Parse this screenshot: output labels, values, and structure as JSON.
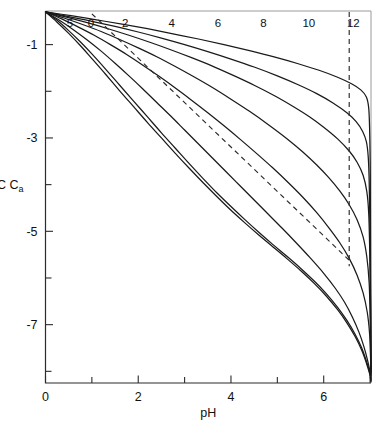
{
  "figure": {
    "background_color": "#ffffff",
    "line_color": "#1a1a1a",
    "dash_color": "#2b2b2b",
    "caption": ""
  },
  "chart_data": {
    "type": "line",
    "title": "",
    "subtitle": "",
    "xlabel": "pH",
    "ylabel": "log C",
    "ylabel_subscript": "a",
    "xlim": [
      0,
      7.02
    ],
    "ylim": [
      -8.25,
      -0.28
    ],
    "grid": false,
    "legend_position": "inline-curve-labels",
    "x_ticks_labeled": [
      0,
      2,
      4,
      6
    ],
    "x_tick_labels": [
      "0",
      "2",
      "4",
      "6"
    ],
    "x_ticks_minor": [
      1,
      3,
      5,
      7
    ],
    "y_ticks_labeled": [
      -1,
      -3,
      -5,
      -7
    ],
    "y_tick_labels": [
      "-1",
      "-3",
      "-5",
      "-7"
    ],
    "y_ticks_minor": [
      -2,
      -4,
      -6,
      -8
    ],
    "series": [
      {
        "name": "5",
        "label": "5",
        "label_x": 0.53,
        "label_y": -0.62,
        "style": "solid",
        "points": [
          [
            0.0,
            -0.3
          ],
          [
            0.25,
            -0.52
          ],
          [
            0.5,
            -0.76
          ],
          [
            0.75,
            -1.02
          ],
          [
            1.0,
            -1.3
          ],
          [
            1.3,
            -1.64
          ],
          [
            1.6,
            -1.99
          ],
          [
            1.9,
            -2.33
          ],
          [
            2.2,
            -2.67
          ],
          [
            2.5,
            -3.0
          ],
          [
            2.8,
            -3.33
          ],
          [
            3.1,
            -3.65
          ],
          [
            3.4,
            -3.96
          ],
          [
            3.7,
            -4.26
          ],
          [
            4.0,
            -4.55
          ],
          [
            4.3,
            -4.82
          ],
          [
            4.6,
            -5.08
          ],
          [
            4.9,
            -5.33
          ],
          [
            5.2,
            -5.58
          ],
          [
            5.5,
            -5.84
          ],
          [
            5.8,
            -6.12
          ],
          [
            6.05,
            -6.38
          ],
          [
            6.3,
            -6.68
          ],
          [
            6.5,
            -6.96
          ],
          [
            6.68,
            -7.26
          ],
          [
            6.82,
            -7.55
          ],
          [
            6.92,
            -7.82
          ],
          [
            6.99,
            -8.05
          ],
          [
            7.02,
            -8.22
          ]
        ]
      },
      {
        "name": "0",
        "label": "0",
        "label_x": 0.98,
        "label_y": -0.62,
        "style": "solid",
        "points": [
          [
            0.0,
            -0.3
          ],
          [
            0.25,
            -0.48
          ],
          [
            0.5,
            -0.7
          ],
          [
            0.75,
            -0.94
          ],
          [
            1.0,
            -1.2
          ],
          [
            1.3,
            -1.53
          ],
          [
            1.6,
            -1.87
          ],
          [
            1.9,
            -2.21
          ],
          [
            2.2,
            -2.55
          ],
          [
            2.5,
            -2.89
          ],
          [
            2.8,
            -3.22
          ],
          [
            3.1,
            -3.55
          ],
          [
            3.4,
            -3.87
          ],
          [
            3.7,
            -4.18
          ],
          [
            4.0,
            -4.47
          ],
          [
            4.3,
            -4.75
          ],
          [
            4.6,
            -5.02
          ],
          [
            4.9,
            -5.28
          ],
          [
            5.2,
            -5.53
          ],
          [
            5.5,
            -5.79
          ],
          [
            5.8,
            -6.07
          ],
          [
            6.05,
            -6.33
          ],
          [
            6.3,
            -6.63
          ],
          [
            6.5,
            -6.91
          ],
          [
            6.68,
            -7.21
          ],
          [
            6.82,
            -7.5
          ],
          [
            6.92,
            -7.78
          ],
          [
            6.99,
            -8.02
          ],
          [
            7.02,
            -8.2
          ]
        ]
      },
      {
        "name": "2",
        "label": "2",
        "label_x": 1.72,
        "label_y": -0.62,
        "style": "solid",
        "points": [
          [
            0.0,
            -0.3
          ],
          [
            0.3,
            -0.48
          ],
          [
            0.6,
            -0.68
          ],
          [
            0.9,
            -0.9
          ],
          [
            1.2,
            -1.14
          ],
          [
            1.5,
            -1.4
          ],
          [
            1.8,
            -1.67
          ],
          [
            2.1,
            -1.95
          ],
          [
            2.4,
            -2.24
          ],
          [
            2.7,
            -2.53
          ],
          [
            3.0,
            -2.83
          ],
          [
            3.3,
            -3.13
          ],
          [
            3.6,
            -3.43
          ],
          [
            3.9,
            -3.73
          ],
          [
            4.2,
            -4.03
          ],
          [
            4.5,
            -4.33
          ],
          [
            4.8,
            -4.63
          ],
          [
            5.1,
            -4.93
          ],
          [
            5.4,
            -5.24
          ],
          [
            5.7,
            -5.56
          ],
          [
            6.0,
            -5.9
          ],
          [
            6.25,
            -6.22
          ],
          [
            6.45,
            -6.52
          ],
          [
            6.62,
            -6.84
          ],
          [
            6.76,
            -7.16
          ],
          [
            6.87,
            -7.48
          ],
          [
            6.95,
            -7.78
          ],
          [
            7.0,
            -8.02
          ],
          [
            7.02,
            -8.18
          ]
        ]
      },
      {
        "name": "4",
        "label": "4",
        "label_x": 2.72,
        "label_y": -0.62,
        "style": "solid",
        "points": [
          [
            0.0,
            -0.3
          ],
          [
            0.35,
            -0.45
          ],
          [
            0.7,
            -0.62
          ],
          [
            1.05,
            -0.8
          ],
          [
            1.4,
            -1.0
          ],
          [
            1.75,
            -1.21
          ],
          [
            2.1,
            -1.44
          ],
          [
            2.45,
            -1.68
          ],
          [
            2.8,
            -1.93
          ],
          [
            3.15,
            -2.19
          ],
          [
            3.5,
            -2.46
          ],
          [
            3.85,
            -2.74
          ],
          [
            4.2,
            -3.03
          ],
          [
            4.55,
            -3.33
          ],
          [
            4.9,
            -3.64
          ],
          [
            5.25,
            -3.97
          ],
          [
            5.55,
            -4.27
          ],
          [
            5.85,
            -4.6
          ],
          [
            6.1,
            -4.91
          ],
          [
            6.35,
            -5.25
          ],
          [
            6.55,
            -5.58
          ],
          [
            6.72,
            -5.94
          ],
          [
            6.85,
            -6.32
          ],
          [
            6.94,
            -6.74
          ],
          [
            6.99,
            -7.2
          ],
          [
            7.01,
            -7.7
          ],
          [
            7.02,
            -8.15
          ]
        ]
      },
      {
        "name": "6",
        "label": "6",
        "label_x": 3.72,
        "label_y": -0.62,
        "style": "solid",
        "points": [
          [
            0.0,
            -0.3
          ],
          [
            0.4,
            -0.43
          ],
          [
            0.8,
            -0.57
          ],
          [
            1.2,
            -0.72
          ],
          [
            1.6,
            -0.89
          ],
          [
            2.0,
            -1.07
          ],
          [
            2.4,
            -1.26
          ],
          [
            2.8,
            -1.47
          ],
          [
            3.2,
            -1.69
          ],
          [
            3.6,
            -1.92
          ],
          [
            4.0,
            -2.17
          ],
          [
            4.4,
            -2.43
          ],
          [
            4.8,
            -2.71
          ],
          [
            5.2,
            -3.01
          ],
          [
            5.55,
            -3.3
          ],
          [
            5.85,
            -3.58
          ],
          [
            6.1,
            -3.84
          ],
          [
            6.35,
            -4.14
          ],
          [
            6.55,
            -4.43
          ],
          [
            6.72,
            -4.75
          ],
          [
            6.85,
            -5.12
          ],
          [
            6.93,
            -5.55
          ],
          [
            6.98,
            -6.1
          ],
          [
            7.0,
            -6.8
          ],
          [
            7.02,
            -8.1
          ]
        ]
      },
      {
        "name": "8",
        "label": "8",
        "label_x": 4.7,
        "label_y": -0.62,
        "style": "solid",
        "points": [
          [
            0.0,
            -0.3
          ],
          [
            0.45,
            -0.41
          ],
          [
            0.9,
            -0.53
          ],
          [
            1.35,
            -0.66
          ],
          [
            1.8,
            -0.8
          ],
          [
            2.25,
            -0.95
          ],
          [
            2.7,
            -1.11
          ],
          [
            3.15,
            -1.28
          ],
          [
            3.6,
            -1.46
          ],
          [
            4.05,
            -1.66
          ],
          [
            4.5,
            -1.87
          ],
          [
            4.95,
            -2.1
          ],
          [
            5.35,
            -2.33
          ],
          [
            5.7,
            -2.55
          ],
          [
            6.0,
            -2.77
          ],
          [
            6.3,
            -3.02
          ],
          [
            6.55,
            -3.28
          ],
          [
            6.72,
            -3.52
          ],
          [
            6.85,
            -3.8
          ],
          [
            6.93,
            -4.15
          ],
          [
            6.97,
            -4.6
          ],
          [
            6.99,
            -5.3
          ],
          [
            7.01,
            -6.6
          ],
          [
            7.02,
            -8.05
          ]
        ]
      },
      {
        "name": "10",
        "label": "10",
        "label_x": 5.68,
        "label_y": -0.62,
        "style": "solid",
        "points": [
          [
            0.0,
            -0.3
          ],
          [
            0.5,
            -0.4
          ],
          [
            1.0,
            -0.5
          ],
          [
            1.5,
            -0.61
          ],
          [
            2.0,
            -0.73
          ],
          [
            2.5,
            -0.86
          ],
          [
            3.0,
            -1.0
          ],
          [
            3.5,
            -1.15
          ],
          [
            4.0,
            -1.31
          ],
          [
            4.5,
            -1.48
          ],
          [
            5.0,
            -1.67
          ],
          [
            5.45,
            -1.86
          ],
          [
            5.85,
            -2.05
          ],
          [
            6.2,
            -2.25
          ],
          [
            6.5,
            -2.46
          ],
          [
            6.7,
            -2.65
          ],
          [
            6.84,
            -2.86
          ],
          [
            6.92,
            -3.08
          ],
          [
            6.96,
            -3.4
          ],
          [
            6.98,
            -3.9
          ],
          [
            7.0,
            -5.0
          ],
          [
            7.01,
            -6.6
          ],
          [
            7.02,
            -8.0
          ]
        ]
      },
      {
        "name": "12",
        "label": "12",
        "label_x": 6.64,
        "label_y": -0.62,
        "style": "solid",
        "points": [
          [
            0.0,
            -0.3
          ],
          [
            0.55,
            -0.38
          ],
          [
            1.1,
            -0.47
          ],
          [
            1.65,
            -0.56
          ],
          [
            2.2,
            -0.66
          ],
          [
            2.75,
            -0.77
          ],
          [
            3.3,
            -0.88
          ],
          [
            3.85,
            -1.0
          ],
          [
            4.4,
            -1.13
          ],
          [
            4.95,
            -1.27
          ],
          [
            5.45,
            -1.41
          ],
          [
            5.9,
            -1.55
          ],
          [
            6.3,
            -1.7
          ],
          [
            6.6,
            -1.84
          ],
          [
            6.8,
            -1.97
          ],
          [
            6.92,
            -2.12
          ],
          [
            6.97,
            -2.35
          ],
          [
            6.99,
            -2.8
          ],
          [
            7.005,
            -3.8
          ],
          [
            7.01,
            -5.5
          ],
          [
            7.02,
            -7.95
          ]
        ]
      }
    ],
    "annotations": [
      {
        "name": "diagonal-dashed-line",
        "style": "dashed",
        "points": [
          [
            1.0,
            -0.34
          ],
          [
            6.55,
            -5.62
          ]
        ]
      },
      {
        "name": "vertical-dashed-line",
        "style": "dashed",
        "x": 6.55,
        "points": [
          [
            6.55,
            -0.3
          ],
          [
            6.55,
            -5.75
          ]
        ]
      }
    ]
  }
}
